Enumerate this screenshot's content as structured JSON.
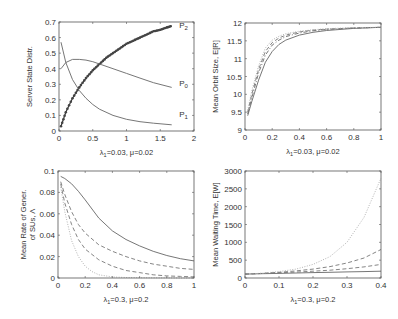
{
  "chart_data": [
    {
      "type": "line",
      "id": "server-state",
      "ylabel": "Server State Distr.",
      "xlabel": "λ1=0.03, μ=0.02",
      "xlabel_main": "λ",
      "xlabel_sub": "1",
      "xlabel_rest": "=0.03, μ=0.02",
      "xlim": [
        0,
        2
      ],
      "ylim": [
        0,
        0.7
      ],
      "xticks": [
        0,
        0.5,
        1,
        1.5,
        2
      ],
      "xtick_labels": [
        "0",
        "0.5",
        "1",
        "1.5",
        "2"
      ],
      "yticks": [
        0,
        0.1,
        0.2,
        0.3,
        0.4,
        0.5,
        0.6,
        0.7
      ],
      "ytick_labels": [
        "0",
        "0.1",
        "0.2",
        "0.3",
        "0.4",
        "0.5",
        "0.6",
        "0.7"
      ],
      "grid": false,
      "box": [
        59,
        22,
        194,
        131
      ],
      "series": [
        {
          "name": "P2",
          "style": "marker",
          "x": [
            0.03,
            0.1,
            0.2,
            0.3,
            0.4,
            0.5,
            0.6,
            0.7,
            0.8,
            0.9,
            1.0,
            1.1,
            1.2,
            1.3,
            1.4,
            1.5,
            1.6,
            1.67
          ],
          "y": [
            0.03,
            0.12,
            0.21,
            0.28,
            0.34,
            0.39,
            0.43,
            0.47,
            0.5,
            0.53,
            0.56,
            0.58,
            0.6,
            0.62,
            0.64,
            0.65,
            0.665,
            0.675
          ]
        },
        {
          "name": "P0",
          "style": "solid",
          "x": [
            0.03,
            0.1,
            0.2,
            0.3,
            0.4,
            0.5,
            0.6,
            0.8,
            1.0,
            1.2,
            1.4,
            1.67
          ],
          "y": [
            0.4,
            0.44,
            0.46,
            0.46,
            0.455,
            0.445,
            0.43,
            0.4,
            0.37,
            0.34,
            0.31,
            0.28
          ]
        },
        {
          "name": "P1",
          "style": "solid",
          "x": [
            0.03,
            0.1,
            0.2,
            0.3,
            0.4,
            0.5,
            0.6,
            0.8,
            1.0,
            1.2,
            1.4,
            1.67
          ],
          "y": [
            0.57,
            0.44,
            0.33,
            0.26,
            0.21,
            0.17,
            0.14,
            0.1,
            0.075,
            0.06,
            0.05,
            0.04
          ]
        }
      ],
      "annotations": [
        {
          "text": "P",
          "sub": "2",
          "x": 1.78,
          "y": 0.66
        },
        {
          "text": "P",
          "sub": "0",
          "x": 1.78,
          "y": 0.29
        },
        {
          "text": "P",
          "sub": "1",
          "x": 1.78,
          "y": 0.09
        }
      ]
    },
    {
      "type": "line",
      "id": "mean-orbit-size",
      "ylabel": "Mean Orbit Size, E[R]",
      "xlabel": "λ1=0.03, μ=0.02",
      "xlabel_main": "λ",
      "xlabel_sub": "1",
      "xlabel_rest": "=0.03, μ=0.02",
      "xlim": [
        0,
        1
      ],
      "ylim": [
        9,
        12
      ],
      "xticks": [
        0,
        0.2,
        0.4,
        0.6,
        0.8,
        1
      ],
      "xtick_labels": [
        "0",
        "0.2",
        "0.4",
        "0.6",
        "0.8",
        "1"
      ],
      "yticks": [
        9,
        9.5,
        10,
        10.5,
        11,
        11.5,
        12
      ],
      "ytick_labels": [
        "9",
        "9.5",
        "10",
        "10.5",
        "11",
        "11.5",
        "12"
      ],
      "grid": false,
      "box": [
        245,
        23,
        381,
        130
      ],
      "series": [
        {
          "name": "series-1",
          "style": "solid",
          "x": [
            0.02,
            0.05,
            0.1,
            0.15,
            0.2,
            0.25,
            0.3,
            0.4,
            0.5,
            0.6,
            0.8,
            1.0
          ],
          "y": [
            9.4,
            9.8,
            10.4,
            10.9,
            11.2,
            11.4,
            11.52,
            11.66,
            11.74,
            11.79,
            11.85,
            11.88
          ]
        },
        {
          "name": "series-2",
          "style": "dashdot",
          "x": [
            0.02,
            0.05,
            0.1,
            0.15,
            0.2,
            0.25,
            0.3,
            0.4,
            0.5,
            0.6,
            0.8,
            1.0
          ],
          "y": [
            9.45,
            9.9,
            10.6,
            11.1,
            11.38,
            11.52,
            11.62,
            11.72,
            11.78,
            11.82,
            11.86,
            11.88
          ]
        },
        {
          "name": "series-3",
          "style": "dashed",
          "x": [
            0.02,
            0.05,
            0.1,
            0.15,
            0.2,
            0.25,
            0.3,
            0.4,
            0.5,
            0.6,
            0.8,
            1.0
          ],
          "y": [
            9.5,
            10.0,
            10.7,
            11.2,
            11.45,
            11.58,
            11.66,
            11.75,
            11.8,
            11.83,
            11.86,
            11.88
          ]
        },
        {
          "name": "series-4",
          "style": "dotted",
          "x": [
            0.02,
            0.05,
            0.1,
            0.15,
            0.2,
            0.25,
            0.3,
            0.4,
            0.5,
            0.6,
            0.8,
            1.0
          ],
          "y": [
            9.55,
            10.1,
            10.8,
            11.3,
            11.52,
            11.63,
            11.7,
            11.77,
            11.81,
            11.84,
            11.87,
            11.88
          ]
        }
      ]
    },
    {
      "type": "line",
      "id": "mean-rate-generation",
      "ylabel": "Mean Rate of Gener. of SUs, Λ",
      "ylabel_line1": "Mean Rate of Gener.",
      "ylabel_line2": "of SUs, Λ",
      "xlabel": "λ1=0.3, μ=0.2",
      "xlabel_main": "λ",
      "xlabel_sub": "1",
      "xlabel_rest": "=0.3, μ=0.2",
      "xlim": [
        0,
        1
      ],
      "ylim": [
        0,
        0.1
      ],
      "xticks": [
        0,
        0.2,
        0.4,
        0.6,
        0.8,
        1
      ],
      "xtick_labels": [
        "0",
        "0.2",
        "0.4",
        "0.6",
        "0.8",
        "1"
      ],
      "yticks": [
        0,
        0.02,
        0.04,
        0.06,
        0.08,
        0.1
      ],
      "ytick_labels": [
        "0",
        "0.02",
        "0.04",
        "0.06",
        "0.08",
        "0.1"
      ],
      "grid": false,
      "box": [
        58,
        171,
        194,
        278
      ],
      "series": [
        {
          "name": "series-1",
          "style": "solid",
          "x": [
            0.02,
            0.05,
            0.1,
            0.15,
            0.2,
            0.3,
            0.4,
            0.5,
            0.6,
            0.7,
            0.8,
            0.9,
            1.0
          ],
          "y": [
            0.095,
            0.093,
            0.088,
            0.081,
            0.073,
            0.056,
            0.044,
            0.036,
            0.03,
            0.025,
            0.021,
            0.018,
            0.016
          ]
        },
        {
          "name": "series-2",
          "style": "dashed",
          "x": [
            0.02,
            0.05,
            0.1,
            0.15,
            0.2,
            0.3,
            0.4,
            0.5,
            0.6,
            0.7,
            0.8,
            0.9,
            1.0
          ],
          "y": [
            0.09,
            0.078,
            0.062,
            0.05,
            0.042,
            0.031,
            0.025,
            0.02,
            0.016,
            0.013,
            0.011,
            0.009,
            0.008
          ]
        },
        {
          "name": "series-3",
          "style": "dashed",
          "x": [
            0.02,
            0.05,
            0.1,
            0.15,
            0.2,
            0.3,
            0.4,
            0.5,
            0.6,
            0.7,
            0.8,
            0.9,
            1.0
          ],
          "y": [
            0.088,
            0.07,
            0.05,
            0.036,
            0.027,
            0.017,
            0.011,
            0.007,
            0.005,
            0.003,
            0.002,
            0.0015,
            0.001
          ]
        },
        {
          "name": "series-4",
          "style": "dotted",
          "x": [
            0.02,
            0.05,
            0.1,
            0.15,
            0.2,
            0.25,
            0.3,
            0.4,
            0.5,
            0.6,
            0.8,
            1.0
          ],
          "y": [
            0.085,
            0.062,
            0.035,
            0.02,
            0.011,
            0.006,
            0.003,
            0.001,
            0.0005,
            0.0003,
            0.0001,
            0
          ]
        }
      ]
    },
    {
      "type": "line",
      "id": "mean-waiting-time",
      "ylabel": "Mean Waiting Time, E[W]",
      "xlabel": "λ1=0.3, μ=0.2",
      "xlabel_main": "λ",
      "xlabel_sub": "1",
      "xlabel_rest": "=0.3, μ=0.2",
      "xlim": [
        0,
        0.4
      ],
      "ylim": [
        0,
        3000
      ],
      "xticks": [
        0,
        0.1,
        0.2,
        0.3,
        0.4
      ],
      "xtick_labels": [
        "0",
        "0.1",
        "0.2",
        "0.3",
        "0.4"
      ],
      "yticks": [
        0,
        500,
        1000,
        1500,
        2000,
        2500,
        3000
      ],
      "ytick_labels": [
        "0",
        "500",
        "1000",
        "1500",
        "2000",
        "2500",
        "3000"
      ],
      "grid": false,
      "box": [
        245,
        171,
        381,
        278
      ],
      "series": [
        {
          "name": "series-1",
          "style": "solid",
          "x": [
            0,
            0.05,
            0.1,
            0.15,
            0.2,
            0.25,
            0.3,
            0.35,
            0.4
          ],
          "y": [
            110,
            120,
            130,
            140,
            150,
            160,
            170,
            180,
            190
          ]
        },
        {
          "name": "series-2",
          "style": "dashed",
          "x": [
            0,
            0.05,
            0.1,
            0.15,
            0.2,
            0.25,
            0.3,
            0.35,
            0.4
          ],
          "y": [
            110,
            125,
            145,
            165,
            190,
            220,
            260,
            310,
            380
          ]
        },
        {
          "name": "series-3",
          "style": "dashed",
          "x": [
            0,
            0.05,
            0.1,
            0.15,
            0.2,
            0.25,
            0.3,
            0.35,
            0.4
          ],
          "y": [
            110,
            130,
            160,
            200,
            250,
            320,
            420,
            560,
            800
          ]
        },
        {
          "name": "series-4",
          "style": "dotted",
          "x": [
            0,
            0.05,
            0.1,
            0.15,
            0.2,
            0.25,
            0.3,
            0.35,
            0.4
          ],
          "y": [
            110,
            135,
            180,
            250,
            380,
            600,
            1000,
            1700,
            2800
          ]
        }
      ]
    }
  ]
}
